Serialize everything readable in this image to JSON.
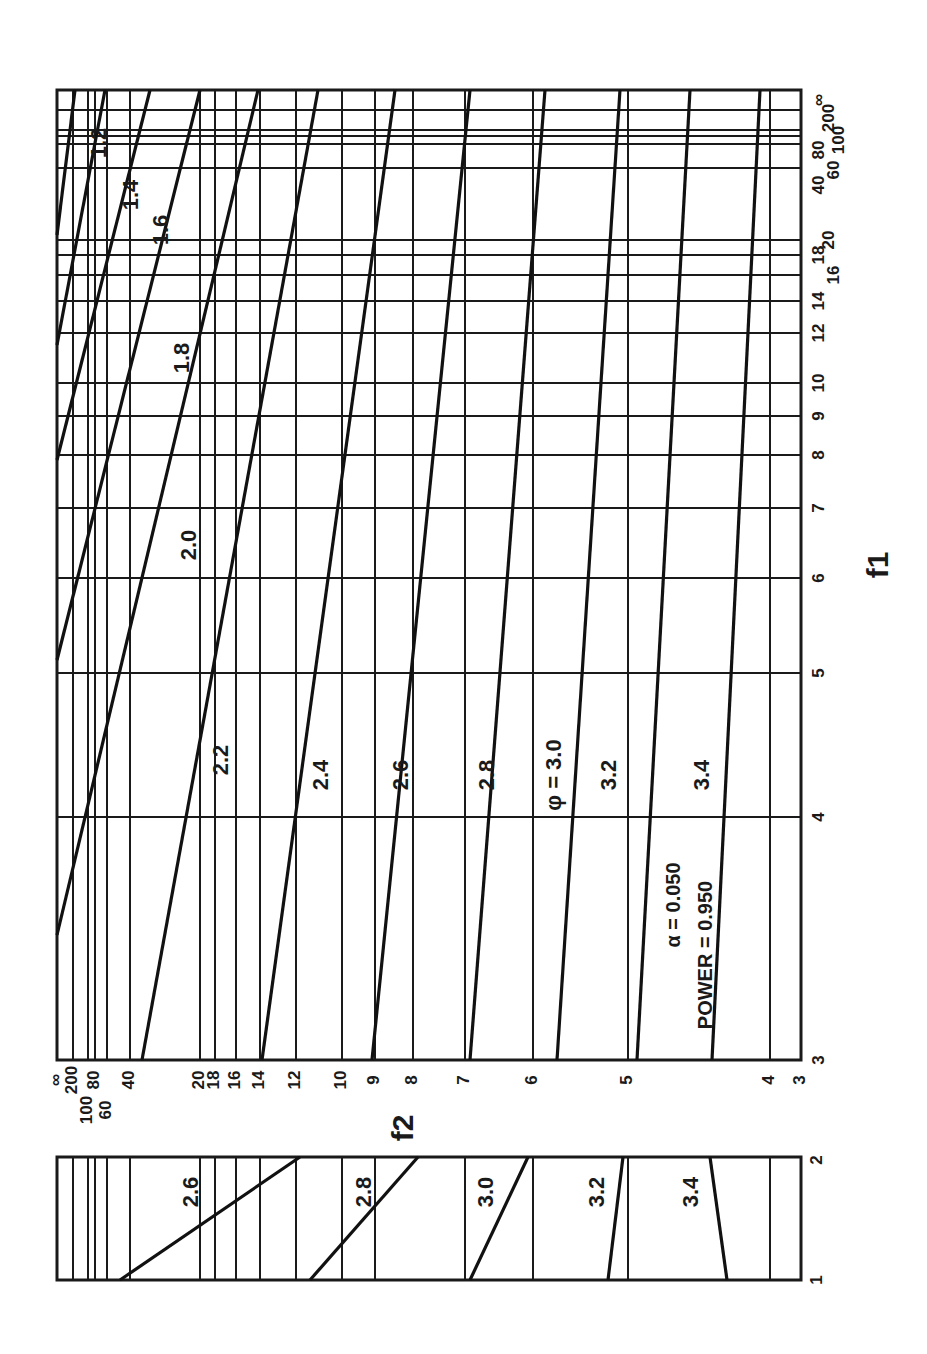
{
  "chart_data": {
    "type": "line",
    "title": "",
    "orientation_note": "figure printed rotated 90 degrees",
    "xlabel": "f2",
    "ylabel": "f1",
    "parameters": {
      "alpha_label": "α",
      "alpha": "0.050",
      "power_label": "POWER",
      "power": "0.950"
    },
    "phi_prefix": "φ = ",
    "f1_ticks": [
      "∞",
      "200",
      "100",
      "80",
      "60",
      "40",
      "20",
      "18",
      "16",
      "14",
      "12",
      "10",
      "9",
      "8",
      "7",
      "6",
      "5",
      "4",
      "3"
    ],
    "f2_ticks": [
      "∞",
      "200",
      "100",
      "80",
      "60",
      "40",
      "20",
      "18",
      "16",
      "14",
      "12",
      "10",
      "9",
      "8",
      "7",
      "6",
      "5",
      "4",
      "3"
    ],
    "lower_panel_f1_ticks": [
      "1",
      "2"
    ],
    "series": [
      {
        "name": "1.2",
        "label": "1.2"
      },
      {
        "name": "1.4",
        "label": "1.4"
      },
      {
        "name": "1.6",
        "label": "1.6"
      },
      {
        "name": "1.8",
        "label": "1.8"
      },
      {
        "name": "2.0",
        "label": "2.0"
      },
      {
        "name": "2.2",
        "label": "2.2"
      },
      {
        "name": "2.4",
        "label": "2.4"
      },
      {
        "name": "2.6",
        "label": "2.6"
      },
      {
        "name": "2.8",
        "label": "2.8"
      },
      {
        "name": "3.0",
        "label": "3.0"
      },
      {
        "name": "3.2",
        "label": "3.2"
      },
      {
        "name": "3.4",
        "label": "3.4"
      }
    ],
    "lower_series": [
      {
        "name": "2.6",
        "label": "2.6"
      },
      {
        "name": "2.8",
        "label": "2.8"
      },
      {
        "name": "3.0",
        "label": "3.0"
      },
      {
        "name": "3.2",
        "label": "3.2"
      },
      {
        "name": "3.4",
        "label": "3.4"
      }
    ],
    "grid": true
  },
  "labels": {
    "f1": "f",
    "f1_sub": "1",
    "f2": "f",
    "f2_sub": "2",
    "alpha_line": "α   =  0.050",
    "power_line": "POWER =  0.950",
    "phi": "φ = 3.0"
  }
}
